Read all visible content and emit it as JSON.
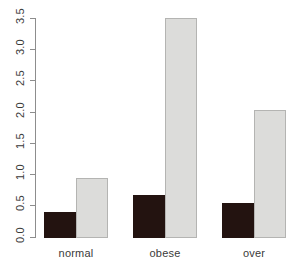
{
  "chart_data": {
    "type": "bar",
    "title": "",
    "xlabel": "",
    "ylabel": "",
    "categories": [
      "normal",
      "obese",
      "over"
    ],
    "series": [
      {
        "name": "dark",
        "color": "#231310",
        "values": [
          0.42,
          0.68,
          0.55
        ]
      },
      {
        "name": "light",
        "color": "#dcdcda",
        "values": [
          0.95,
          3.5,
          2.03
        ]
      }
    ],
    "ylim": [
      0.0,
      3.5
    ],
    "yticks": [
      "0.0",
      "0.5",
      "1.0",
      "1.5",
      "2.0",
      "2.5",
      "3.0",
      "3.5"
    ],
    "ytick_values": [
      0.0,
      0.5,
      1.0,
      1.5,
      2.0,
      2.5,
      3.0,
      3.5
    ],
    "grid": false,
    "legend": "none",
    "axis_color": "#8d8d8d",
    "background": "#ffffff"
  },
  "axis": {
    "y_ticks": [
      {
        "label": "0.0"
      },
      {
        "label": "0.5"
      },
      {
        "label": "1.0"
      },
      {
        "label": "1.5"
      },
      {
        "label": "2.0"
      },
      {
        "label": "2.5"
      },
      {
        "label": "3.0"
      },
      {
        "label": "3.5"
      }
    ],
    "x_labels": [
      {
        "label": "normal"
      },
      {
        "label": "obese"
      },
      {
        "label": "over"
      }
    ]
  }
}
